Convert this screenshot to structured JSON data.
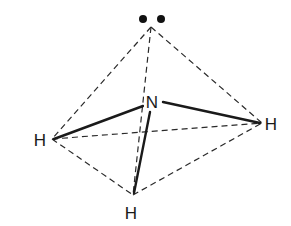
{
  "diagram": {
    "title": "",
    "type": "molecular-geometry",
    "molecule": "NH3",
    "central_atom": {
      "label": "N",
      "x": 152,
      "y": 102
    },
    "lone_pair": {
      "label": "••",
      "x": 152,
      "y": 19
    },
    "atoms": [
      {
        "id": "h-left",
        "label": "H",
        "x": 40,
        "y": 140
      },
      {
        "id": "h-right",
        "label": "H",
        "x": 271,
        "y": 124
      },
      {
        "id": "h-bottom",
        "label": "H",
        "x": 131,
        "y": 213
      }
    ],
    "solid_bonds": [
      {
        "from": "N",
        "to": "h-left"
      },
      {
        "from": "N",
        "to": "h-right"
      },
      {
        "from": "N",
        "to": "h-bottom"
      }
    ],
    "dashed_edges": [
      {
        "from": "lone-pair",
        "to": "h-left"
      },
      {
        "from": "lone-pair",
        "to": "h-right"
      },
      {
        "from": "lone-pair",
        "to": "h-bottom"
      },
      {
        "from": "h-left",
        "to": "h-right"
      },
      {
        "from": "h-left",
        "to": "h-bottom"
      },
      {
        "from": "h-bottom",
        "to": "h-right"
      }
    ],
    "colors": {
      "line": "#1a1a1a",
      "background": "#ffffff"
    }
  }
}
